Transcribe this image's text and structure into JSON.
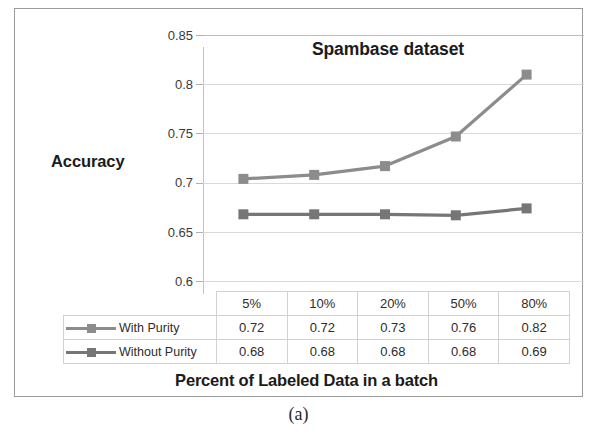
{
  "figure": {
    "caption": "(a)"
  },
  "chart_data": {
    "type": "line",
    "title": "Spambase dataset",
    "xlabel": "Percent of Labeled Data in a batch",
    "ylabel": "Accuracy",
    "categories": [
      "5%",
      "10%",
      "20%",
      "50%",
      "80%"
    ],
    "series": [
      {
        "name": "With Purity",
        "values": [
          0.72,
          0.72,
          0.73,
          0.76,
          0.82
        ],
        "plotted_values": [
          0.716,
          0.72,
          0.729,
          0.759,
          0.822
        ],
        "color": "#8c8c8c",
        "marker": "square"
      },
      {
        "name": "Without Purity",
        "values": [
          0.68,
          0.68,
          0.68,
          0.68,
          0.69
        ],
        "plotted_values": [
          0.68,
          0.68,
          0.68,
          0.679,
          0.686
        ],
        "color": "#767676",
        "marker": "square"
      }
    ],
    "ylim": [
      0.6,
      0.85
    ],
    "yticks": [
      0.85,
      0.8,
      0.75,
      0.7,
      0.65,
      0.6
    ],
    "ytick_labels": [
      "0.85",
      "0.8",
      "0.75",
      "0.7",
      "0.65",
      "0.6"
    ],
    "grid": true,
    "legend_position": "data-table-left",
    "data_table_visible": true
  },
  "table": {
    "header": [
      "",
      "5%",
      "10%",
      "20%",
      "50%",
      "80%"
    ],
    "rows": [
      {
        "label": "With Purity",
        "cells": [
          "0.72",
          "0.72",
          "0.73",
          "0.76",
          "0.82"
        ]
      },
      {
        "label": "Without Purity",
        "cells": [
          "0.68",
          "0.68",
          "0.68",
          "0.68",
          "0.69"
        ]
      }
    ]
  },
  "colors": {
    "series_with_purity": "#8c8c8c",
    "series_without_purity": "#767676",
    "gridline": "#d9d9d9",
    "frame_border": "#9a9a9a",
    "text": "#1b1b1b"
  }
}
